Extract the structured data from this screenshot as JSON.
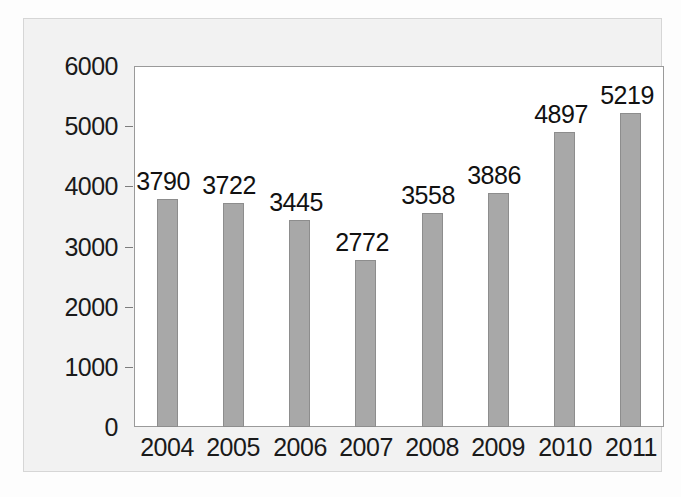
{
  "chart_data": {
    "type": "bar",
    "title": "",
    "subtitle": "",
    "xlabel": "",
    "ylabel": "",
    "categories": [
      "2004",
      "2005",
      "2006",
      "2007",
      "2008",
      "2009",
      "2010",
      "2011"
    ],
    "values": [
      3790,
      3722,
      3445,
      2772,
      3558,
      3886,
      4897,
      5219
    ],
    "value_labels": [
      "3790",
      "3722",
      "3445",
      "2772",
      "3558",
      "3886",
      "4897",
      "5219"
    ],
    "ylim": [
      0,
      6000
    ],
    "yticks": [
      0,
      1000,
      2000,
      3000,
      4000,
      5000,
      6000
    ],
    "ytick_labels": [
      "0",
      "1000",
      "2000",
      "3000",
      "4000",
      "5000",
      "6000"
    ],
    "grid": false,
    "legend": null,
    "legend_position": "none",
    "series": [
      {
        "name": "",
        "values": [
          3790,
          3722,
          3445,
          2772,
          3558,
          3886,
          4897,
          5219
        ]
      }
    ],
    "colors": {
      "bar_fill": "#a8a8a8",
      "bar_edge": "#8d8d8d",
      "plot_background": "#ffffff",
      "figure_background": "#f2f2f2",
      "axis_line": "#9a9a9a",
      "text": "#1a1a1a"
    }
  }
}
